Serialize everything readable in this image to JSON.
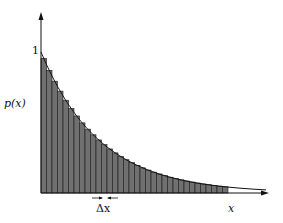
{
  "chart_data": {
    "type": "bar",
    "title": "",
    "xlabel": "x",
    "ylabel": "p(x)",
    "y_tick_labels": [
      "1"
    ],
    "annotation": "Δx",
    "bar_width_label": "Δx",
    "grid": false,
    "legend": null,
    "ylim": [
      0,
      1.2
    ],
    "x_bins": 34,
    "values": [
      1.0,
      0.911,
      0.83,
      0.756,
      0.689,
      0.627,
      0.572,
      0.521,
      0.474,
      0.432,
      0.394,
      0.359,
      0.327,
      0.298,
      0.271,
      0.247,
      0.225,
      0.205,
      0.187,
      0.17,
      0.155,
      0.141,
      0.129,
      0.117,
      0.107,
      0.097,
      0.089,
      0.081,
      0.074,
      0.067,
      0.061,
      0.056,
      0.051,
      0.046
    ],
    "curve": {
      "name": "p(x)",
      "form": "exponential decay",
      "value_at_0": 1.0,
      "decay_per_bin": 0.0932
    }
  },
  "labels": {
    "y_tick_1": "1",
    "y_axis": "p(x)",
    "x_axis": "x",
    "delta": "Δx"
  },
  "colors": {
    "bar_fill": "#707070",
    "bar_edge": "#1a1a1a",
    "axis": "#111111",
    "curve": "#111111"
  }
}
